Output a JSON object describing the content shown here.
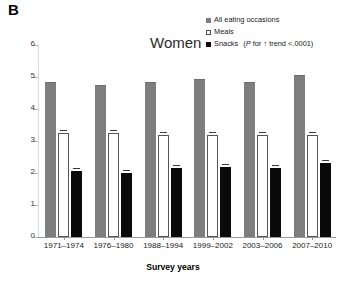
{
  "panel": {
    "label": "B"
  },
  "title": "Women",
  "legend": {
    "items": [
      {
        "label": "All eating occasions",
        "swatch": "filled-gray-square-icon",
        "color": "#7e7e7e"
      },
      {
        "label": "Meals",
        "swatch": "open-white-square-icon",
        "color": "#ffffff"
      },
      {
        "label": "Snacks",
        "swatch": "filled-black-square-icon",
        "color": "#0a0a0a"
      }
    ],
    "note_italic": "P",
    "note_rest": " for ↑ trend <.0001",
    "note_open": "(",
    "note_close": ")"
  },
  "axes": {
    "y_title": "Number per day",
    "x_title": "Survey years",
    "y_ticks": [
      "0",
      "1",
      "2",
      "3",
      "4",
      "5",
      "6"
    ],
    "y_min": 0,
    "y_max": 6
  },
  "chart_data": {
    "type": "bar",
    "title": "Women",
    "xlabel": "Survey years",
    "ylabel": "Number per day",
    "ylim": [
      0,
      6
    ],
    "grid": false,
    "legend_position": "top-right",
    "categories": [
      "1971–1974",
      "1976–1980",
      "1988–1994",
      "1999–2002",
      "2003–2006",
      "2007–2010"
    ],
    "series": [
      {
        "name": "All eating occasions",
        "color": "#7e7e7e",
        "values": [
          4.85,
          4.75,
          4.85,
          4.95,
          4.85,
          5.05
        ]
      },
      {
        "name": "Meals",
        "color": "#ffffff",
        "values": [
          3.25,
          3.25,
          3.2,
          3.2,
          3.2,
          3.2
        ]
      },
      {
        "name": "Snacks",
        "color": "#0a0a0a",
        "values": [
          2.05,
          2.0,
          2.15,
          2.2,
          2.15,
          2.3
        ]
      }
    ],
    "annotations": [
      "P for ↑ trend <.0001 (Snacks)"
    ]
  }
}
